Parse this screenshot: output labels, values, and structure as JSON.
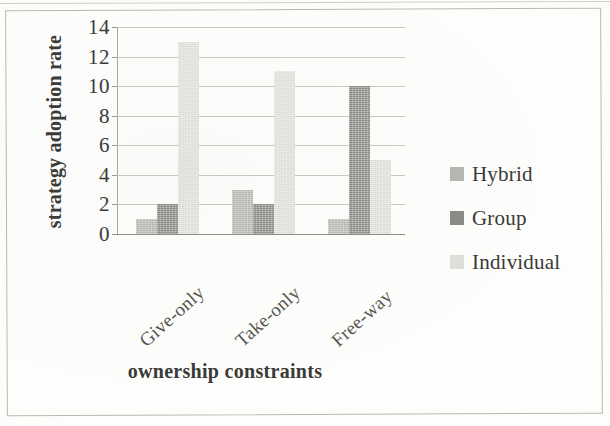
{
  "chart_data": {
    "type": "bar",
    "title": "",
    "xlabel": "ownership constraints",
    "ylabel": "strategy adoption rate",
    "categories": [
      "Give-only",
      "Take-only",
      "Free-way"
    ],
    "series": [
      {
        "name": "Hybrid",
        "values": [
          1,
          3,
          1
        ],
        "color": "#b6b6b2"
      },
      {
        "name": "Group",
        "values": [
          2,
          2,
          10
        ],
        "color": "#8b8b88"
      },
      {
        "name": "Individual",
        "values": [
          13,
          11,
          5
        ],
        "color": "#dededa"
      }
    ],
    "ylim": [
      0,
      14
    ],
    "ytick_labels": [
      "0",
      "2",
      "4",
      "6",
      "8",
      "10",
      "12",
      "14"
    ],
    "ytick_values": [
      0,
      2,
      4,
      6,
      8,
      10,
      12,
      14
    ],
    "grid": true,
    "legend_position": "right"
  },
  "axes": {
    "y_title": "strategy adoption rate",
    "x_title": "ownership constraints"
  },
  "legend": {
    "entries": [
      {
        "label": "Hybrid",
        "swatch": "hybrid"
      },
      {
        "label": "Group",
        "swatch": "group"
      },
      {
        "label": "Individual",
        "swatch": "individual"
      }
    ]
  }
}
